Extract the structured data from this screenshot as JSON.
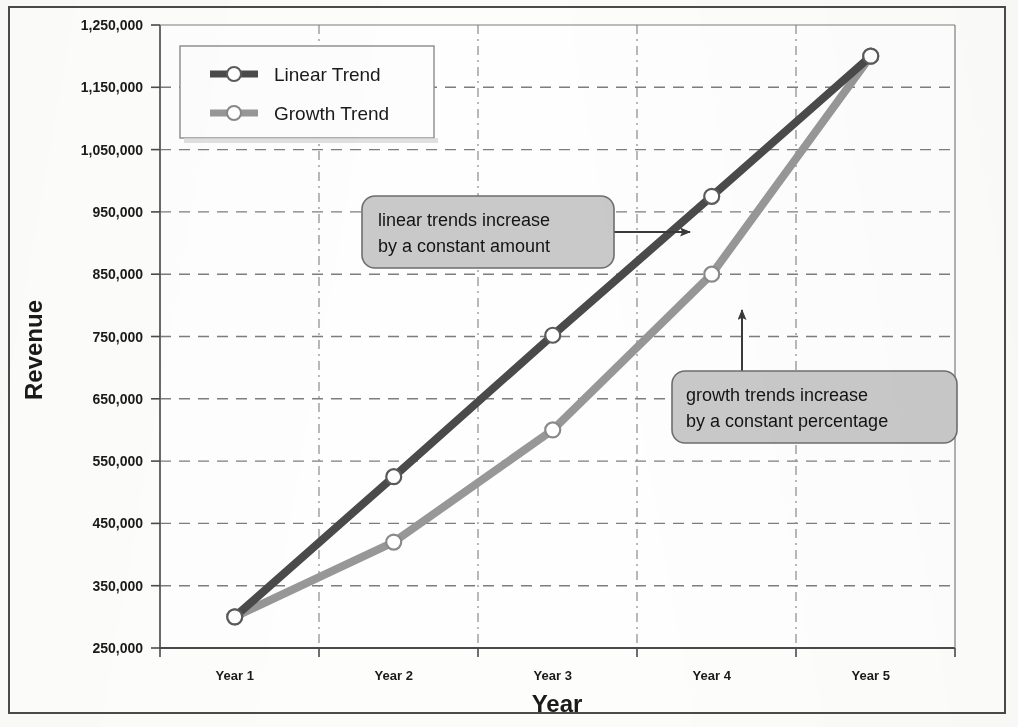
{
  "chart_data": {
    "type": "line",
    "title": "",
    "xlabel": "Year",
    "ylabel": "Revenue",
    "categories": [
      "Year 1",
      "Year 2",
      "Year 3",
      "Year 4",
      "Year 5"
    ],
    "series": [
      {
        "name": "Linear Trend",
        "values": [
          300000,
          525000,
          752000,
          975000,
          1200000
        ],
        "color": "#4a4a4a"
      },
      {
        "name": "Growth Trend",
        "values": [
          300000,
          420000,
          600000,
          850000,
          1200000
        ],
        "color": "#979797"
      }
    ],
    "ylim": [
      250000,
      1250000
    ],
    "ytick_step": 100000,
    "ytick_labels": [
      "1,250,000",
      "1,150,000",
      "1,050,000",
      "950,000",
      "850,000",
      "750,000",
      "650,000",
      "550,000",
      "450,000",
      "350,000",
      "250,000"
    ],
    "ytick_values": [
      1250000,
      1150000,
      1050000,
      950000,
      850000,
      750000,
      650000,
      550000,
      450000,
      350000,
      250000
    ],
    "grid": "both-dashed",
    "legend_position": "top-left-inside",
    "marker": "open-circle",
    "annotations": [
      {
        "id": "linear-callout",
        "text_lines": [
          "linear trends increase",
          "by a constant amount"
        ],
        "points_to": "Linear Trend between Year 3 and Year 4",
        "arrow_direction": "right",
        "fill": "#c9c9c9"
      },
      {
        "id": "growth-callout",
        "text_lines": [
          "growth trends increase",
          "by a constant percentage"
        ],
        "points_to": "Growth Trend at Year 4",
        "arrow_direction": "up",
        "fill": "#c9c9c9"
      }
    ]
  },
  "legend": {
    "items": [
      {
        "label": "Linear Trend",
        "color": "#4a4a4a"
      },
      {
        "label": "Growth Trend",
        "color": "#979797"
      }
    ]
  },
  "axes": {
    "y_title": "Revenue",
    "x_title": "Year"
  },
  "colors": {
    "linear_trend": "#4a4a4a",
    "growth_trend": "#979797",
    "grid": "#7d7d7d",
    "axis": "#5a5a5a",
    "callout_fill": "#c9c9c9",
    "callout_stroke": "#6e6e6e",
    "page_border": "#4a4a4a",
    "text": "#1a1a1a"
  }
}
